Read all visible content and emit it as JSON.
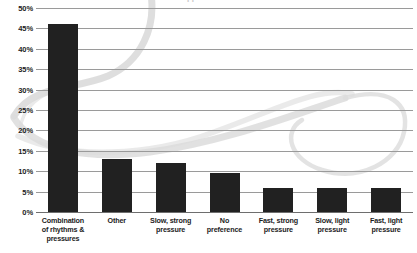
{
  "chart_data": {
    "type": "bar",
    "title": "",
    "xlabel": "",
    "ylabel": "",
    "ylim": [
      0,
      50
    ],
    "ytick_step": 5,
    "grid": true,
    "legend": "none",
    "y_tick_labels": [
      "50%",
      "45%",
      "40%",
      "35%",
      "30%",
      "25%",
      "20%",
      "15%",
      "10%",
      "5%",
      "0%"
    ],
    "y_tick_values": [
      50,
      45,
      40,
      35,
      30,
      25,
      20,
      15,
      10,
      5,
      0
    ],
    "categories": [
      "Combination of rhythms & pressures",
      "Other",
      "Slow, strong pressure",
      "No preference",
      "Fast, strong pressure",
      "Slow, light pressure",
      "Fast, light pressure"
    ],
    "category_lines": [
      [
        "Combination",
        "of rhythms &",
        "pressures"
      ],
      [
        "Other"
      ],
      [
        "Slow, strong",
        "pressure"
      ],
      [
        "No",
        "preference"
      ],
      [
        "Fast, strong",
        "pressure"
      ],
      [
        "Slow, light",
        "pressure"
      ],
      [
        "Fast, light",
        "pressure"
      ]
    ],
    "values": [
      46,
      13,
      12,
      9.5,
      6,
      6,
      6
    ],
    "value_labels": [
      "46%",
      "13%",
      "12%",
      "9.5%",
      "6%",
      "6%",
      "6%"
    ],
    "colors": {
      "bar": "#212121",
      "gridline": "#9a9a9a",
      "axis": "#6e6e6e",
      "text": "#1c1c1c",
      "background": "#ffffff",
      "watermark": "#d8d8d8"
    }
  },
  "title_remnant": "clipped title text"
}
